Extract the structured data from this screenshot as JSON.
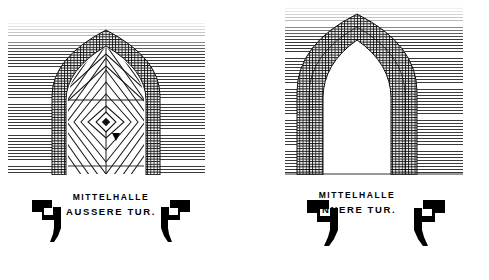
{
  "plate": {
    "background_color": "#ffffff",
    "ink_color": "#111111",
    "width": 489,
    "height": 280
  },
  "figures": [
    {
      "id": "left",
      "caption_line1": "MITTELHALLE",
      "caption_line2": "AUSSERE TUR.",
      "arch_type": "pointed-gothic",
      "door": "closed-panelled",
      "door_pattern": "concentric-diamond-chevron",
      "wall_hatch": "horizontal-lines",
      "profiles": [
        "jamb-section-left",
        "jamb-section-right"
      ]
    },
    {
      "id": "right",
      "caption_line1": "MITTELHALLE",
      "caption_line2": "INNERE TUR.",
      "arch_type": "pointed-gothic",
      "door": "open-void",
      "door_pattern": "none",
      "wall_hatch": "horizontal-lines",
      "profiles": [
        "jamb-section-left",
        "jamb-section-right"
      ]
    }
  ]
}
